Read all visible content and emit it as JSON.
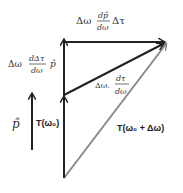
{
  "labels": {
    "top_coef": "Δω",
    "top_num": "dp̂",
    "top_den": "dω",
    "top_tail": "Δτ",
    "left_coef": "Δω",
    "left_num": "dΔτ",
    "left_den": "dω",
    "left_tail": "p̂",
    "diag_coef": "Δω.",
    "diag_num": "dτ",
    "diag_den": "dω",
    "p_hat": "p̂",
    "t_omega0": "T(ω₀)",
    "t_omega0_plus": "T(ω₀ + Δω)"
  },
  "colors": {
    "black_arrow": "#222222",
    "gray_arrow": "#8a8a8a"
  }
}
